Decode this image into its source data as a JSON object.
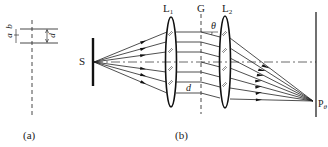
{
  "panel_a": {
    "caption": "(a)",
    "label_b": "b",
    "label_a": "a",
    "label_d": "d"
  },
  "panel_b": {
    "caption": "(b)",
    "source_label": "S",
    "lens1_label": "L",
    "lens1_sub": "1",
    "grating_label": "G",
    "lens2_label": "L",
    "lens2_sub": "2",
    "angle_label": "θ",
    "spacing_label": "d",
    "point_label": "P",
    "point_sub": "θ"
  },
  "colors": {
    "ink": "#222222",
    "background": "#ffffff"
  }
}
